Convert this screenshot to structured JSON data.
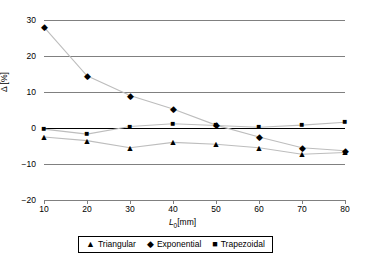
{
  "chart_data": {
    "type": "line",
    "title": "",
    "subtitle": "",
    "xlabel": "L_0 [mm]",
    "xlabel_parts": {
      "symbol": "L",
      "subscript": "0",
      "unit": "[mm]"
    },
    "ylabel": "Δ [%]",
    "ylabel_parts": {
      "symbol": "Δ",
      "unit": "[%]"
    },
    "x": [
      10,
      20,
      30,
      40,
      50,
      60,
      70,
      80
    ],
    "xticklabels": [
      "10",
      "20",
      "30",
      "40",
      "50",
      "60",
      "70",
      "80"
    ],
    "yticklabels": [
      "30",
      "20",
      "10",
      "0",
      "−10",
      "−20"
    ],
    "yticks": [
      30,
      20,
      10,
      0,
      -10,
      -20
    ],
    "xlim": [
      10,
      80
    ],
    "ylim": [
      -20,
      30
    ],
    "grid": true,
    "grid_axis": "y",
    "legend_position": "bottom-center",
    "series": [
      {
        "name": "Triangular",
        "marker": "triangle",
        "glyph": "▲",
        "color": "#000000",
        "line_color": "#bdbdbd",
        "values": [
          -2.5,
          -3.5,
          -5.5,
          -4.0,
          -4.5,
          -5.5,
          -7.3,
          -6.8
        ]
      },
      {
        "name": "Exponential",
        "marker": "diamond",
        "glyph": "◆",
        "color": "#000000",
        "line_color": "#bdbdbd",
        "values": [
          28.0,
          14.5,
          9.0,
          5.3,
          0.8,
          -2.5,
          -5.5,
          -6.3
        ]
      },
      {
        "name": "Trapezoidal",
        "marker": "square",
        "glyph": "■",
        "color": "#000000",
        "line_color": "#bdbdbd",
        "values": [
          -0.3,
          -1.7,
          0.4,
          1.2,
          0.7,
          0.2,
          0.8,
          1.6
        ]
      }
    ]
  },
  "legend": {
    "items": [
      {
        "label": "Triangular",
        "glyph": "▲"
      },
      {
        "label": "Exponential",
        "glyph": "◆"
      },
      {
        "label": "Trapezoidal",
        "glyph": "■"
      }
    ]
  },
  "colors": {
    "gridline": "#808080",
    "zero_line": "#000000",
    "marker": "#000000",
    "series_line": "#bdbdbd",
    "background": "#ffffff"
  }
}
